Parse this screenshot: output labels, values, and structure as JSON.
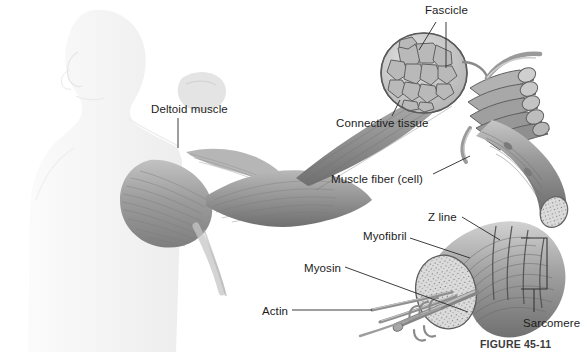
{
  "figure": {
    "caption": "FIGURE 45-11",
    "caption_position": {
      "x": 480,
      "y": 338
    },
    "background_color": "#ffffff",
    "label_color": "#1c1c1c",
    "leader_color": "#333333"
  },
  "labels": [
    {
      "id": "fascicle",
      "text": "Fascicle",
      "x": 425,
      "y": 5
    },
    {
      "id": "deltoid-muscle",
      "text": "Deltoid muscle",
      "x": 151,
      "y": 104
    },
    {
      "id": "connective-tissue",
      "text": "Connective tissue",
      "x": 336,
      "y": 118
    },
    {
      "id": "muscle-fiber-cell",
      "text": "Muscle fiber (cell)",
      "x": 331,
      "y": 174
    },
    {
      "id": "z-line",
      "text": "Z line",
      "x": 428,
      "y": 212
    },
    {
      "id": "myofibril",
      "text": "Myofibril",
      "x": 363,
      "y": 231
    },
    {
      "id": "myosin",
      "text": "Myosin",
      "x": 304,
      "y": 263
    },
    {
      "id": "actin",
      "text": "Actin",
      "x": 262,
      "y": 306
    },
    {
      "id": "sarcomere",
      "text": "Sarcomere",
      "x": 523,
      "y": 318
    }
  ],
  "leaders": [
    {
      "id": "fascicle-leader-diagonal",
      "from": [
        436,
        22
      ],
      "to": [
        419,
        50
      ]
    },
    {
      "id": "fascicle-leader-vertical",
      "from": [
        446,
        22
      ],
      "to": [
        446,
        68
      ]
    },
    {
      "id": "deltoid-leader",
      "from": [
        178,
        118
      ],
      "to": [
        178,
        148
      ]
    },
    {
      "id": "connective-leader",
      "from": [
        392,
        116
      ],
      "to": [
        400,
        100
      ]
    },
    {
      "id": "muscle-fiber-leader",
      "from": [
        433,
        174
      ],
      "to": [
        470,
        156
      ]
    },
    {
      "id": "z-line-leader",
      "from": [
        462,
        217
      ],
      "to": [
        500,
        240
      ]
    },
    {
      "id": "myofibril-leader",
      "from": [
        410,
        238
      ],
      "to": [
        470,
        258
      ]
    },
    {
      "id": "myosin-leader",
      "from": [
        345,
        267
      ],
      "to": [
        468,
        312
      ]
    },
    {
      "id": "actin-leader",
      "from": [
        292,
        310
      ],
      "to": [
        372,
        310
      ]
    }
  ],
  "bracket": {
    "id": "sarcomere-bracket",
    "x_spine": 547,
    "y_top": 238,
    "y_bottom": 289,
    "arm_length": 26,
    "stem_from": [
      534,
      289
    ],
    "stem_to": [
      534,
      312
    ]
  },
  "anatomy_parts": [
    {
      "id": "human-silhouette",
      "name": "human figure profile silhouette",
      "tone": "#f2f2f2"
    },
    {
      "id": "deltoid",
      "name": "deltoid muscle with striations",
      "tone": "#a6a6a6"
    },
    {
      "id": "muscle-belly",
      "name": "whole muscle tapering belly",
      "tone": "#9c9c9c"
    },
    {
      "id": "fascicle-cross-section",
      "name": "fascicle cross section with polygonal bundles",
      "tone": "#b5b5b5"
    },
    {
      "id": "fascicle-bundle",
      "name": "bundle of cylindrical fascicles",
      "tone": "#aeaeae"
    },
    {
      "id": "muscle-fiber",
      "name": "single muscle fiber cylinder",
      "tone": "#8f8f8f"
    },
    {
      "id": "myofibril",
      "name": "myofibril with stippled face and striations",
      "tone": "#c9c9c9"
    },
    {
      "id": "myosin-filament",
      "name": "thick myosin filament with heads",
      "tone": "#8a8a8a"
    },
    {
      "id": "actin-filaments",
      "name": "thin actin filaments",
      "tone": "#9a9a9a"
    }
  ]
}
